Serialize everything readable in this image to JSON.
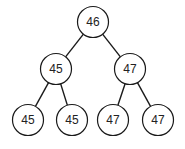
{
  "diagram": {
    "type": "binary-tree",
    "style": {
      "stroke": "#1a1a1a",
      "fill": "#ffffff",
      "text": "#222222",
      "radius": 15.5
    },
    "nodes": [
      {
        "id": "n0",
        "label": "46",
        "cx": 93,
        "cy": 22
      },
      {
        "id": "n1",
        "label": "45",
        "cx": 56,
        "cy": 69
      },
      {
        "id": "n2",
        "label": "47",
        "cx": 130,
        "cy": 69
      },
      {
        "id": "n3",
        "label": "45",
        "cx": 28,
        "cy": 120
      },
      {
        "id": "n4",
        "label": "45",
        "cx": 72,
        "cy": 120
      },
      {
        "id": "n5",
        "label": "47",
        "cx": 113,
        "cy": 120
      },
      {
        "id": "n6",
        "label": "47",
        "cx": 158,
        "cy": 120
      }
    ],
    "edges": [
      {
        "from": "n0",
        "to": "n1"
      },
      {
        "from": "n0",
        "to": "n2"
      },
      {
        "from": "n1",
        "to": "n3"
      },
      {
        "from": "n1",
        "to": "n4"
      },
      {
        "from": "n2",
        "to": "n5"
      },
      {
        "from": "n2",
        "to": "n6"
      }
    ]
  }
}
